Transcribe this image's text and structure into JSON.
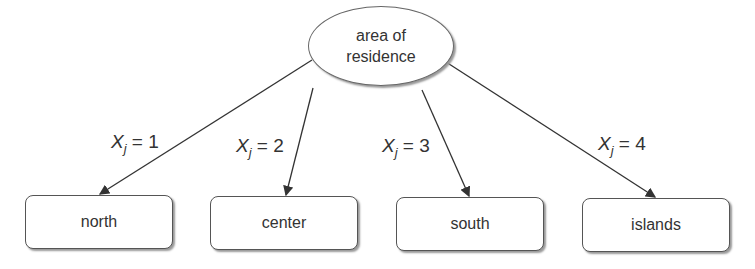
{
  "root": {
    "line1": "area of",
    "line2": "residence"
  },
  "children": [
    {
      "label": "north",
      "edge_var": "X",
      "edge_sub": "j",
      "edge_eq": " = 1"
    },
    {
      "label": "center",
      "edge_var": "X",
      "edge_sub": "j",
      "edge_eq": " = 2"
    },
    {
      "label": "south",
      "edge_var": "X",
      "edge_sub": "j",
      "edge_eq": " = 3"
    },
    {
      "label": "islands",
      "edge_var": "X",
      "edge_sub": "j",
      "edge_eq": " = 4"
    }
  ]
}
